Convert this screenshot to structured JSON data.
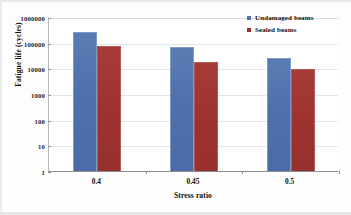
{
  "chart_data": {
    "type": "bar",
    "title": "",
    "xlabel": "Stress ratio",
    "ylabel": "Fatigue life (cycles)",
    "categories": [
      "0.4",
      "0.45",
      "0.5"
    ],
    "series": [
      {
        "name": "Undamaged beams",
        "color": "#4f71ab",
        "values": [
          250000,
          70000,
          26000
        ]
      },
      {
        "name": "Sealed beams",
        "color": "#9e3330",
        "values": [
          75000,
          17000,
          9500
        ]
      }
    ],
    "yscale": "log",
    "ylim": [
      1,
      1000000
    ],
    "ytick_labels": [
      "1000000",
      "100000",
      "10000",
      "1000",
      "100",
      "10",
      "1"
    ],
    "ytick_values": [
      1000000,
      100000,
      10000,
      1000,
      100,
      10,
      1
    ],
    "grid": true,
    "legend_position": "top-right"
  },
  "legend": {
    "entries": [
      {
        "label": "Undamaged beams",
        "color": "#4f71ab"
      },
      {
        "label": "Sealed beams",
        "color": "#9e3330"
      }
    ]
  },
  "axes": {
    "y_title": "Fatigue life (cycles)",
    "x_title": "Stress ratio"
  }
}
